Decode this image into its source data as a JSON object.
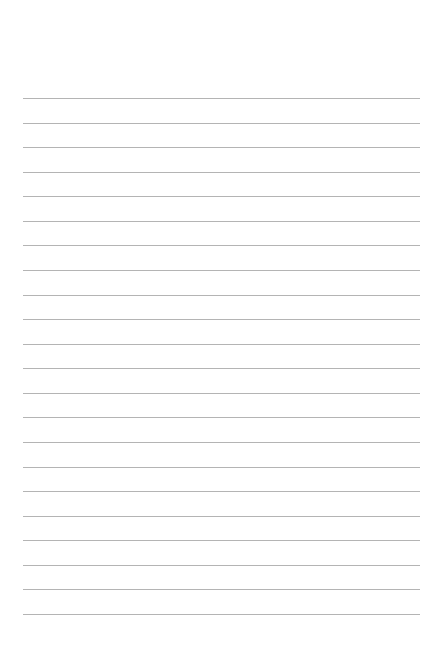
{
  "page": {
    "type": "lined-paper",
    "background_color": "#ffffff",
    "line_color": "#b4b4b4",
    "line_count": 22,
    "first_line_y": 98,
    "line_spacing": 24.57,
    "line_left": 23,
    "line_width": 397
  }
}
